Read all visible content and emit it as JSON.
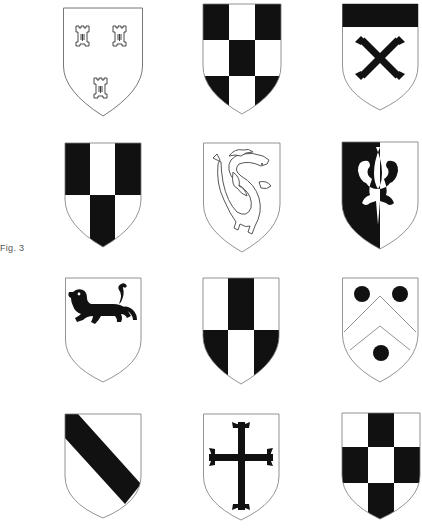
{
  "figure": {
    "caption": "Fig. 3",
    "layout": {
      "columns": 3,
      "rows": 4
    },
    "colors": {
      "ink": "#111111",
      "field": "#ffffff",
      "outline": "#777777"
    },
    "shields": [
      {
        "row": 1,
        "col": 1,
        "name": "three-towers",
        "description": "Argent, three towers (2 and 1)"
      },
      {
        "row": 1,
        "col": 2,
        "name": "checky",
        "description": "Checky, sable and argent"
      },
      {
        "row": 1,
        "col": 3,
        "name": "chief-saltire",
        "description": "Argent, a chief sable and a saltire couped sable"
      },
      {
        "row": 2,
        "col": 1,
        "name": "pale-counterchanged",
        "description": "Per fess, a pale counterchanged sable and argent"
      },
      {
        "row": 2,
        "col": 2,
        "name": "dragon",
        "description": "Argent, a dragon (wyvern) outlined"
      },
      {
        "row": 2,
        "col": 3,
        "name": "fleur-de-lis-per-pale",
        "description": "Per pale sable and argent, a fleur-de-lis counterchanged"
      },
      {
        "row": 3,
        "col": 1,
        "name": "lion-passant",
        "description": "Argent, a lion passant sable in chief"
      },
      {
        "row": 3,
        "col": 2,
        "name": "pale-counterchanged-inverse",
        "description": "Per fess, a pale counterchanged argent and sable"
      },
      {
        "row": 3,
        "col": 3,
        "name": "chevron-three-roundels",
        "description": "Argent, a chevron between three roundels sable"
      },
      {
        "row": 4,
        "col": 1,
        "name": "bend",
        "description": "Argent, a bend sable"
      },
      {
        "row": 4,
        "col": 2,
        "name": "cross-patonce",
        "description": "Argent, a cross patonce sable"
      },
      {
        "row": 4,
        "col": 3,
        "name": "checky-inverse",
        "description": "Checky, argent and sable"
      }
    ]
  }
}
